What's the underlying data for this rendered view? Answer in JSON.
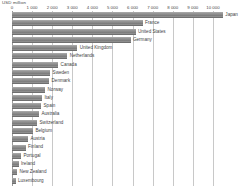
{
  "chart_data": {
    "type": "bar",
    "orientation": "horizontal",
    "title": "USD million",
    "xlabel": "USD million",
    "ylabel": "",
    "xlim": [
      0,
      10900
    ],
    "grid": true,
    "legend": "none",
    "tick_labels": [
      "0",
      "1 000",
      "2 000",
      "3 000",
      "4 000",
      "5 000",
      "6 000",
      "7 000",
      "8 000",
      "9 000",
      "10 000"
    ],
    "tick_values": [
      0,
      1000,
      2000,
      3000,
      4000,
      5000,
      6000,
      7000,
      8000,
      9000,
      10000
    ],
    "categories": [
      "Japan",
      "France",
      "United States",
      "Germany",
      "United Kingdom",
      "Netherlands",
      "Canada",
      "Sweden",
      "Denmark",
      "Norway",
      "Italy",
      "Spain",
      "Australia",
      "Switzerland",
      "Belgium",
      "Austria",
      "Finland",
      "Portugal",
      "Ireland",
      "New Zealand",
      "Luxembourg"
    ],
    "values": [
      10500,
      6500,
      6150,
      5900,
      3250,
      2750,
      2300,
      1900,
      1850,
      1650,
      1500,
      1450,
      1350,
      1250,
      1050,
      800,
      680,
      450,
      330,
      250,
      180
    ],
    "bar_color": "#8d8d8d",
    "grid_color": "#c8c8c8",
    "axis_color": "#9a9a9a",
    "text_color": "#3f3f3f"
  }
}
